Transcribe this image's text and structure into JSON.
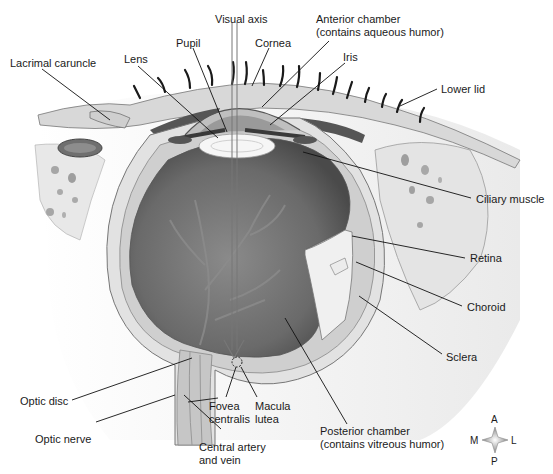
{
  "diagram": {
    "colors": {
      "line": "#111111",
      "tissue_light": "#e6e6e6",
      "tissue_mid": "#bdbdbd",
      "vitreous_dark": "#6e6e6e",
      "lens": "#f4f4f4"
    },
    "labels": {
      "visual_axis": "Visual axis",
      "anterior_chamber_1": "Anterior chamber",
      "anterior_chamber_2": "(contains aqueous humor)",
      "pupil": "Pupil",
      "cornea": "Cornea",
      "lens": "Lens",
      "iris": "Iris",
      "lacrimal_caruncle": "Lacrimal caruncle",
      "lower_lid": "Lower lid",
      "ciliary_muscle": "Ciliary muscle",
      "retina": "Retina",
      "choroid": "Choroid",
      "sclera": "Sclera",
      "optic_disc": "Optic disc",
      "optic_nerve": "Optic nerve",
      "fovea_centralis_1": "Fovea",
      "fovea_centralis_2": "centralis",
      "macula_lutea_1": "Macula",
      "macula_lutea_2": "lutea",
      "central_artery_1": "Central artery",
      "central_artery_2": "and vein",
      "posterior_chamber_1": "Posterior chamber",
      "posterior_chamber_2": "(contains vitreous humor)"
    },
    "compass": {
      "top": "A",
      "bottom": "P",
      "left": "M",
      "right": "L"
    }
  }
}
